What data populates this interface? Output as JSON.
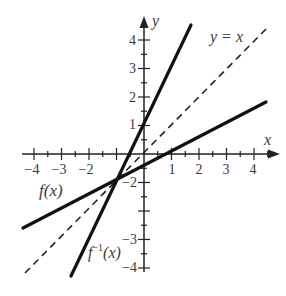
{
  "diagram": {
    "title": "",
    "axes": {
      "x_label": "x",
      "y_label": "y",
      "x_ticks": [
        "−4",
        "−3",
        "−2",
        "1",
        "2",
        "3",
        "4"
      ],
      "y_ticks": [
        "4",
        "3",
        "2",
        "1",
        "−2",
        "−3",
        "−4"
      ],
      "x_range": [
        -4.3,
        4.5
      ],
      "y_range": [
        -4.3,
        4.8
      ]
    },
    "curves": [
      {
        "name": "f",
        "label": "f(x)",
        "equation": "y = 0.5x - 0.5",
        "style": "solid"
      },
      {
        "name": "f_inverse",
        "label": "f⁻¹(x)",
        "label_base": "f",
        "label_sup": "−1",
        "label_arg": "(x)",
        "equation": "y = 2x + 1",
        "style": "solid"
      },
      {
        "name": "identity",
        "label": "y = x",
        "equation": "y = x",
        "style": "dashed"
      }
    ],
    "colors": {
      "line": "#111111",
      "text": "#3a3a3a",
      "background": "#ffffff"
    }
  }
}
